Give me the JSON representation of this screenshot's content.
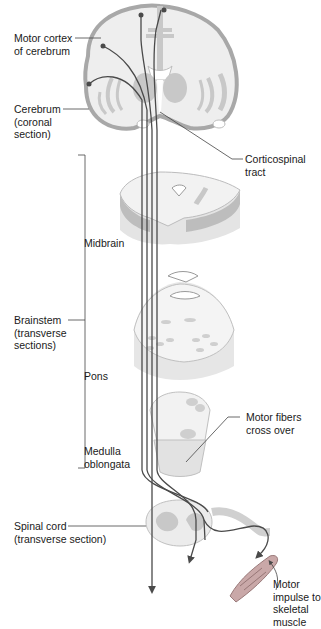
{
  "figure": {
    "labels": {
      "motor_cortex": [
        "Motor cortex",
        "of cerebrum"
      ],
      "cerebrum": [
        "Cerebrum",
        "(coronal",
        "section)"
      ],
      "corticospinal": [
        "Corticospinal",
        "tract"
      ],
      "midbrain": [
        "Midbrain"
      ],
      "brainstem": [
        "Brainstem",
        "(transverse",
        "sections)"
      ],
      "pons": [
        "Pons"
      ],
      "medulla": [
        "Medulla",
        "oblongata"
      ],
      "motor_fibers": [
        "Motor fibers",
        "cross over"
      ],
      "spinal_cord": [
        "Spinal cord",
        "(transverse section)"
      ],
      "motor_impulse": [
        "Motor",
        "impulse to",
        "skeletal",
        "muscle"
      ]
    },
    "colors": {
      "tissue_light": "#ececec",
      "tissue_mid": "#c9c9c9",
      "tissue_dark": "#a9a9a9",
      "outline": "#9a9a9a",
      "tract": "#4a4a4a",
      "muscle": "#b08080"
    }
  }
}
